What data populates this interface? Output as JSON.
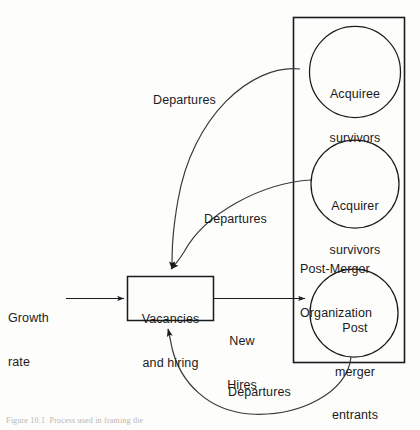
{
  "figure": {
    "caption": "Figure 10.1  Process used in framing the"
  },
  "colors": {
    "stroke": "#1b1b1b",
    "curve": "#3a3a3a",
    "text": "#1b1b1b",
    "background": "#fdfdfc",
    "caption": "#b9b5ae"
  },
  "nodes": {
    "growth_rate": {
      "label": "Growth\nrate",
      "line1": "Growth",
      "line2": "rate"
    },
    "vacancies_box": {
      "label": "Vacancies\nand hiring",
      "line1": "Vacancies",
      "line2": "and hiring"
    },
    "container": {
      "label": "Post-Merger\nOrganization",
      "line1": "Post-Merger",
      "line2": "Organization"
    },
    "acquiree_survivors": {
      "label": "Acquiree\nsurvivors",
      "line1": "Acquiree",
      "line2": "survivors"
    },
    "acquirer_survivors": {
      "label": "Acquirer\nsurvivors",
      "line1": "Acquirer",
      "line2": "survivors"
    },
    "post_merger_entrants": {
      "label": "Post\nmerger\nentrants",
      "line1": "Post",
      "line2": "merger",
      "line3": "entrants"
    }
  },
  "flows": {
    "new_hires": {
      "label": "New\nHires",
      "line1": "New",
      "line2": "Hires"
    },
    "departures_acquiree": {
      "label": "Departures"
    },
    "departures_acquirer": {
      "label": "Departures"
    },
    "departures_entrants": {
      "label": "Departures"
    }
  }
}
